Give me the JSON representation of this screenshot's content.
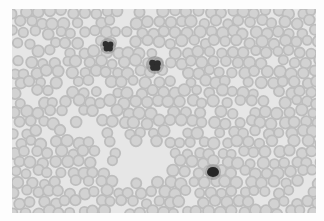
{
  "image": {
    "subject": "Blood smear micrograph (grayscale)",
    "description": "Dense field of red blood cells with three dark-stained white blood cells",
    "width": 324,
    "height": 221,
    "smear_region": {
      "x": 12,
      "y": 9,
      "width": 304,
      "height": 204
    },
    "colors": {
      "border": "#fdfdfd",
      "background": "#e6e6e6",
      "rbc_rim": "#bdbdbd",
      "rbc_center": "#d2d2d2",
      "wbc": "#2e2e2e"
    },
    "rbc": {
      "radius": 5.2,
      "spacing": 11.5
    },
    "wbc": [
      {
        "type": "lobed",
        "cx": 96,
        "cy": 37,
        "r": 6
      },
      {
        "type": "lobed",
        "cx": 143,
        "cy": 56,
        "r": 7
      },
      {
        "type": "round",
        "cx": 201,
        "cy": 163,
        "r": 6
      }
    ],
    "clear_zones": [
      {
        "cx": 120,
        "cy": 155,
        "rx": 40,
        "ry": 18
      },
      {
        "cx": 235,
        "cy": 90,
        "rx": 28,
        "ry": 14
      },
      {
        "cx": 60,
        "cy": 120,
        "rx": 22,
        "ry": 10
      }
    ]
  }
}
